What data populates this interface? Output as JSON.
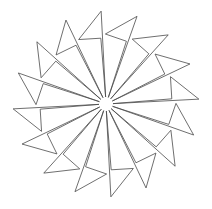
{
  "figure": {
    "width": 212,
    "height": 209,
    "background": "#ffffff",
    "stroke_color": "#4a4a4a",
    "stroke_width": 0.8,
    "center": [
      106,
      104
    ],
    "unit_count": 16,
    "start_angle_deg": -93,
    "step_angle_deg": 22.5,
    "unit_shape": {
      "apex": {
        "r": 7,
        "offset_deg": 0
      },
      "sliver_top": {
        "r": 66,
        "offset_deg": -1.5
      },
      "flag_vertex": {
        "r": 70,
        "offset_deg": -20
      },
      "tip": {
        "r": 93,
        "offset_deg": 0
      }
    }
  }
}
